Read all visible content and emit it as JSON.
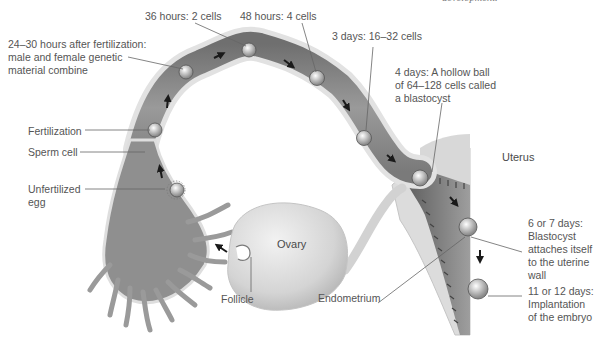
{
  "diagram": {
    "title_fragment": "development.",
    "structures": {
      "uterus": "Uterus",
      "ovary": "Ovary",
      "follicle": "Follicle",
      "endometrium": "Endometrium"
    },
    "left_labels": {
      "combine_line1": "24–30 hours after fertilization:",
      "combine_line2": "male and female genetic",
      "combine_line3": "material combine",
      "fertilization": "Fertilization",
      "sperm_cell": "Sperm cell",
      "unfertilized_line1": "Unfertilized",
      "unfertilized_line2": "egg"
    },
    "top_labels": {
      "h36": "36 hours: 2 cells",
      "h48": "48 hours: 4 cells",
      "d3": "3 days: 16–32 cells",
      "d4_line1": "4 days: A hollow ball",
      "d4_line2": "of 64–128 cells called",
      "d4_line3": "a blastocyst"
    },
    "right_labels": {
      "d6_line1": "6 or 7 days:",
      "d6_line2": "Blastocyst",
      "d6_line3": "attaches itself",
      "d6_line4": "to the uterine",
      "d6_line5": "wall",
      "d11_line1": "11 or 12 days:",
      "d11_line2": "Implantation",
      "d11_line3": "of the embryo"
    },
    "colors": {
      "tube_outer": "#d9d9d9",
      "tube_inner": "#8c8c8c",
      "label_text": "#555555",
      "leader_line": "#666666",
      "arrow": "#1a1a1a"
    }
  }
}
